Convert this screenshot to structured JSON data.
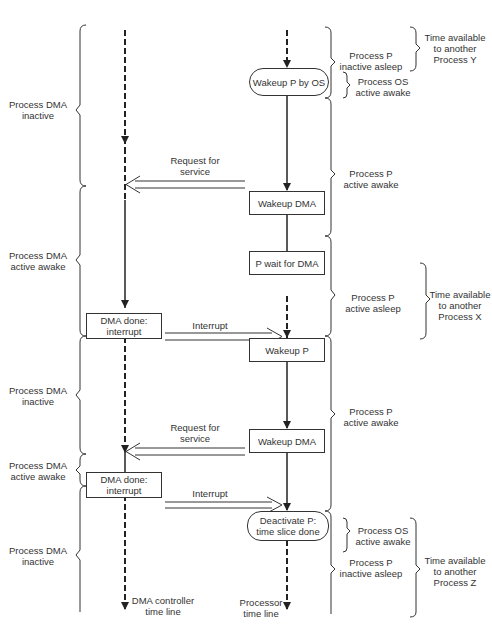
{
  "timelines": {
    "dma": {
      "label_line1": "DMA controller",
      "label_line2": "time line"
    },
    "processor": {
      "label_line1": "Processor",
      "label_line2": "time line"
    }
  },
  "boxes": {
    "wakeup_p_by_os": "Wakeup P by OS",
    "wakeup_dma_1": "Wakeup DMA",
    "p_wait_for_dma": "P wait for DMA",
    "dma_done_1_l1": "DMA done:",
    "dma_done_1_l2": "interrupt",
    "wakeup_p": "Wakeup P",
    "wakeup_dma_2": "Wakeup DMA",
    "dma_done_2_l1": "DMA done:",
    "dma_done_2_l2": "interrupt",
    "deactivate_p_l1": "Deactivate P:",
    "deactivate_p_l2": "time slice done"
  },
  "arrows": {
    "request_1_l1": "Request for",
    "request_1_l2": "service",
    "interrupt_1": "Interrupt",
    "request_2_l1": "Request for",
    "request_2_l2": "service",
    "interrupt_2": "Interrupt"
  },
  "left_states": [
    {
      "l1": "Process DMA",
      "l2": "inactive"
    },
    {
      "l1": "Process DMA",
      "l2": "active awake"
    },
    {
      "l1": "Process DMA",
      "l2": "inactive"
    },
    {
      "l1": "Process DMA",
      "l2": "active awake"
    },
    {
      "l1": "Process DMA",
      "l2": "inactive"
    }
  ],
  "right_states": [
    {
      "l1": "Process P",
      "l2": "inactive asleep"
    },
    {
      "l1": "Process OS",
      "l2": "active awake"
    },
    {
      "l1": "Process P",
      "l2": "active awake"
    },
    {
      "l1": "Process P",
      "l2": "active asleep"
    },
    {
      "l1": "Process P",
      "l2": "active awake"
    },
    {
      "l1": "Process OS",
      "l2": "active awake"
    },
    {
      "l1": "Process P",
      "l2": "inactive asleep"
    }
  ],
  "other_process": [
    {
      "l1": "Time available",
      "l2": "to another",
      "l3": "Process Y"
    },
    {
      "l1": "Time available",
      "l2": "to another",
      "l3": "Process X"
    },
    {
      "l1": "Time available",
      "l2": "to another",
      "l3": "Process Z"
    }
  ]
}
